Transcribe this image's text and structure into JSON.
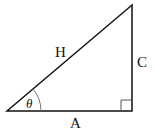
{
  "diagram": {
    "type": "right-triangle",
    "labels": {
      "hypotenuse": "H",
      "opposite": "C",
      "adjacent": "A",
      "angle": "θ"
    },
    "colors": {
      "stroke": "#111111",
      "right_angle_marker": "#555555",
      "arc": "#777777"
    }
  }
}
